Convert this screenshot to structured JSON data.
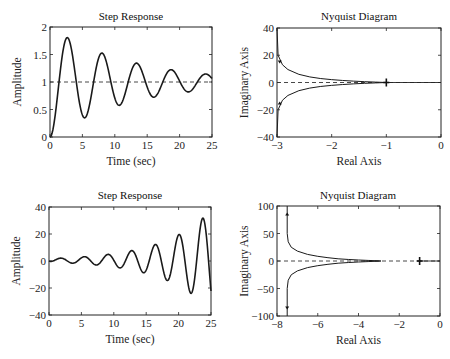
{
  "chart_data": [
    {
      "type": "line",
      "panel": "top-left",
      "title": "Step Response",
      "xlabel": "Time (sec)",
      "ylabel": "Amplitude",
      "xlim": [
        0,
        25
      ],
      "ylim": [
        0,
        2
      ],
      "xticks": [
        "0",
        "5",
        "10",
        "15",
        "20",
        "25"
      ],
      "yticks": [
        "0",
        "0.5",
        "1",
        "1.5",
        "2"
      ],
      "reference_line": {
        "y": 1,
        "style": "dashed"
      },
      "series": [
        {
          "name": "step response (stable, underdamped)",
          "model": {
            "kind": "damped",
            "final": 1,
            "zeta": 0.068,
            "omega_n": 1.18
          },
          "x": [
            0,
            1,
            2,
            2.9,
            4,
            5.5,
            7,
            8.1,
            9.5,
            10.8,
            12,
            13.4,
            15,
            16.1,
            17.5,
            18.9,
            20,
            21.5,
            23,
            24.5,
            25
          ],
          "values": [
            0,
            0.6,
            1.45,
            1.7,
            1.3,
            0.48,
            1.05,
            1.4,
            1.05,
            0.72,
            0.95,
            1.22,
            1.0,
            0.84,
            0.98,
            1.12,
            1.02,
            0.9,
            0.98,
            1.08,
            1.06
          ]
        }
      ]
    },
    {
      "type": "line",
      "panel": "top-right",
      "title": "Nyquist Diagram",
      "xlabel": "Real Axis",
      "ylabel": "Imaginary Axis",
      "xlim": [
        -3,
        0
      ],
      "ylim": [
        -40,
        40
      ],
      "xticks": [
        "-3",
        "-2",
        "-1",
        "0"
      ],
      "yticks": [
        "-40",
        "-20",
        "0",
        "20",
        "40"
      ],
      "reference_line": {
        "y": 0,
        "style": "dashed"
      },
      "critical_point": {
        "x": -1,
        "y": 0,
        "marker": "+"
      },
      "series": [
        {
          "name": "positive frequencies",
          "x": [
            -3.0,
            -2.98,
            -2.9,
            -2.8,
            -2.6,
            -2.4,
            -2.2,
            -2.0,
            -1.8,
            -1.6,
            -1.4,
            -1.2,
            -1.0
          ],
          "values": [
            40,
            20,
            13,
            9.5,
            6.0,
            4.1,
            2.9,
            2.1,
            1.5,
            1.0,
            0.6,
            0.3,
            0
          ]
        },
        {
          "name": "negative frequencies (mirror)",
          "x": [
            -3.0,
            -2.98,
            -2.9,
            -2.8,
            -2.6,
            -2.4,
            -2.2,
            -2.0,
            -1.8,
            -1.6,
            -1.4,
            -1.2,
            -1.0
          ],
          "values": [
            -40,
            -20,
            -13,
            -9.5,
            -6.0,
            -4.1,
            -2.9,
            -2.1,
            -1.5,
            -1.0,
            -0.6,
            -0.3,
            0
          ]
        }
      ],
      "arrows": [
        {
          "x": -2.95,
          "y": 14,
          "dir": "down"
        },
        {
          "x": -2.95,
          "y": -14,
          "dir": "up"
        }
      ]
    },
    {
      "type": "line",
      "panel": "bottom-left",
      "title": "Step Response",
      "xlabel": "Time (sec)",
      "ylabel": "Amplitude",
      "xlim": [
        0,
        25
      ],
      "ylim": [
        -40,
        40
      ],
      "xticks": [
        "0",
        "5",
        "10",
        "15",
        "20",
        "25"
      ],
      "yticks": [
        "-40",
        "-20",
        "0",
        "20",
        "40"
      ],
      "series": [
        {
          "name": "step response (unstable, growing oscillation)",
          "model": {
            "kind": "growing",
            "offset": 0.5,
            "amp": 1.3,
            "growth": 0.134,
            "omega": 1.72,
            "phase": -1.5
          },
          "x": [
            0,
            2.2,
            4.0,
            5.7,
            7.5,
            9.3,
            11.1,
            12.9,
            14.8,
            16.6,
            18.4,
            20.3,
            22.1,
            23.9,
            25
          ],
          "values": [
            0,
            2,
            -0.5,
            3,
            -1.5,
            4,
            -3.5,
            6.5,
            -7,
            11,
            -14,
            19.5,
            -24,
            34,
            -10
          ]
        }
      ]
    },
    {
      "type": "line",
      "panel": "bottom-right",
      "title": "Nyquist Diagram",
      "xlabel": "Real Axis",
      "ylabel": "Imaginary Axis",
      "xlim": [
        -8,
        0
      ],
      "ylim": [
        -100,
        100
      ],
      "xticks": [
        "-8",
        "-6",
        "-4",
        "-2",
        "0"
      ],
      "yticks": [
        "-100",
        "-50",
        "0",
        "50",
        "100"
      ],
      "reference_line": {
        "y": 0,
        "style": "dashed"
      },
      "critical_point": {
        "x": -1,
        "y": 0,
        "marker": "+"
      },
      "series": [
        {
          "name": "positive frequencies",
          "x": [
            -7.5,
            -7.5,
            -7.45,
            -7.3,
            -7.0,
            -6.5,
            -6.0,
            -5.5,
            -5.0,
            -4.5,
            -4.0,
            -3.5,
            -3.0,
            -2.9
          ],
          "values": [
            100,
            50,
            35,
            25,
            18,
            12,
            8.5,
            6,
            4,
            2.8,
            1.8,
            1.0,
            0.3,
            0
          ]
        },
        {
          "name": "negative frequencies (mirror)",
          "x": [
            -7.5,
            -7.5,
            -7.45,
            -7.3,
            -7.0,
            -6.5,
            -6.0,
            -5.5,
            -5.0,
            -4.5,
            -4.0,
            -3.5,
            -3.0,
            -2.9
          ],
          "values": [
            -100,
            -50,
            -35,
            -25,
            -18,
            -12,
            -8.5,
            -6,
            -4,
            -2.8,
            -1.8,
            -1.0,
            -0.3,
            0
          ]
        }
      ],
      "arrows": [
        {
          "x": -7.5,
          "y": 88,
          "dir": "up"
        },
        {
          "x": -7.5,
          "y": -88,
          "dir": "down"
        }
      ]
    }
  ],
  "layout": {
    "panels": [
      {
        "box": [
          50,
          27,
          212,
          137
        ]
      },
      {
        "box": [
          277,
          28,
          441,
          137
        ]
      },
      {
        "box": [
          49,
          207,
          211,
          315
        ]
      },
      {
        "box": [
          277,
          206,
          440,
          316
        ]
      }
    ]
  }
}
